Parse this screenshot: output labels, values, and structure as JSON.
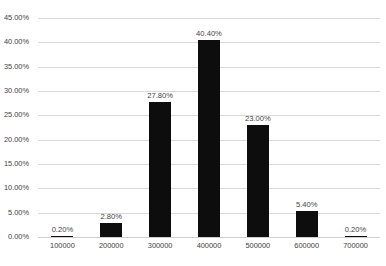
{
  "chart_data": {
    "type": "bar",
    "title": "",
    "subtitle": "",
    "xlabel": "",
    "ylabel": "",
    "categories": [
      "100000",
      "200000",
      "300000",
      "400000",
      "500000",
      "600000",
      "700000"
    ],
    "values": [
      0.2,
      2.8,
      27.8,
      40.4,
      23.0,
      5.4,
      0.2
    ],
    "data_labels": [
      "0.20%",
      "2.80%",
      "27.80%",
      "40.40%",
      "23.00%",
      "5.40%",
      "0.20%"
    ],
    "series": [
      {
        "name": "",
        "values": [
          0.2,
          2.8,
          27.8,
          40.4,
          23.0,
          5.4,
          0.2
        ]
      }
    ],
    "ylim": [
      0,
      45
    ],
    "ytick_values": [
      0,
      5,
      10,
      15,
      20,
      25,
      30,
      35,
      40,
      45
    ],
    "ytick_labels": [
      "0.00%",
      "5.00%",
      "10.00%",
      "15.00%",
      "20.00%",
      "25.00%",
      "30.00%",
      "35.00%",
      "40.00%",
      "45.00%"
    ],
    "grid": true,
    "grid_axis": "y",
    "legend": false,
    "legend_position": "none",
    "bar_color": "#0d0d0d",
    "gridline_color": "#d9d9d9",
    "background_color": "#ffffff",
    "text_color": "#404040",
    "annotations": []
  }
}
